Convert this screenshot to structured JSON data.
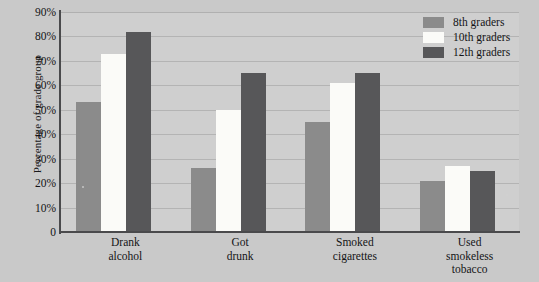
{
  "chart_data": {
    "type": "bar",
    "title": "",
    "xlabel": "",
    "ylabel": "Percentage of grade group",
    "ylim": [
      0,
      90
    ],
    "ytick_labels": [
      "90%",
      "80%",
      "70%",
      "60%",
      "50%",
      "40%",
      "30%",
      "20%",
      "10%",
      "0"
    ],
    "ytick_values": [
      90,
      80,
      70,
      60,
      50,
      40,
      30,
      20,
      10,
      0
    ],
    "grid": true,
    "legend_position": "top-right",
    "categories": [
      "Drank alcohol",
      "Got drunk",
      "Smoked cigarettes",
      "Used smokeless tobacco"
    ],
    "category_lines": [
      [
        "Drank",
        "alcohol"
      ],
      [
        "Got",
        "drunk"
      ],
      [
        "Smoked",
        "cigarettes"
      ],
      [
        "Used",
        "smokeless",
        "tobacco"
      ]
    ],
    "series": [
      {
        "name": "8th graders",
        "color": "#8b8b8b",
        "values": [
          53,
          26,
          45,
          21
        ]
      },
      {
        "name": "10th graders",
        "color": "#fbfbf8",
        "values": [
          73,
          50,
          61,
          27
        ]
      },
      {
        "name": "12th graders",
        "color": "#575759",
        "values": [
          82,
          65,
          65,
          25
        ]
      }
    ]
  },
  "legend": {
    "items": [
      {
        "label": "8th graders"
      },
      {
        "label": "10th graders"
      },
      {
        "label": "12th graders"
      }
    ]
  },
  "colors": {
    "background": "#c9c9c9",
    "plot_background": "#cfcfcf",
    "gridline": "#b4b4b4",
    "axis": "#4a4a4c",
    "text": "#141416",
    "series_8th": "#8b8b8b",
    "series_10th": "#fbfbf8",
    "series_12th": "#575759"
  }
}
